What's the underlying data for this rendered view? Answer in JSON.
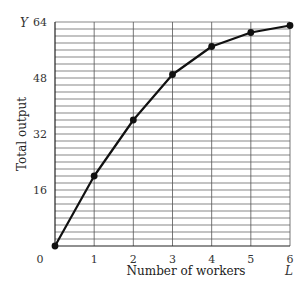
{
  "chart_data": {
    "type": "line",
    "title": "",
    "xlabel": "Number of workers",
    "ylabel": "Total output",
    "x_symbol": "L",
    "y_symbol": "Y",
    "x": [
      0,
      1,
      2,
      3,
      4,
      5,
      6
    ],
    "series": [
      {
        "name": "Total output",
        "values": [
          0,
          20,
          36,
          49,
          57,
          61,
          63
        ]
      }
    ],
    "xlim": [
      0,
      6
    ],
    "ylim": [
      0,
      64
    ],
    "x_ticks": [
      0,
      1,
      2,
      3,
      4,
      5,
      6
    ],
    "x_tick_labels": [
      "0",
      "1",
      "2",
      "3",
      "4",
      "5",
      "6"
    ],
    "y_ticks": [
      16,
      32,
      48,
      64
    ],
    "y_tick_labels": [
      "16",
      "32",
      "48",
      "64"
    ],
    "grid": true,
    "grid_y_step": 2,
    "grid_x_step": 1,
    "line_color": "#111111",
    "grid_color": "#555555",
    "markers": true
  }
}
